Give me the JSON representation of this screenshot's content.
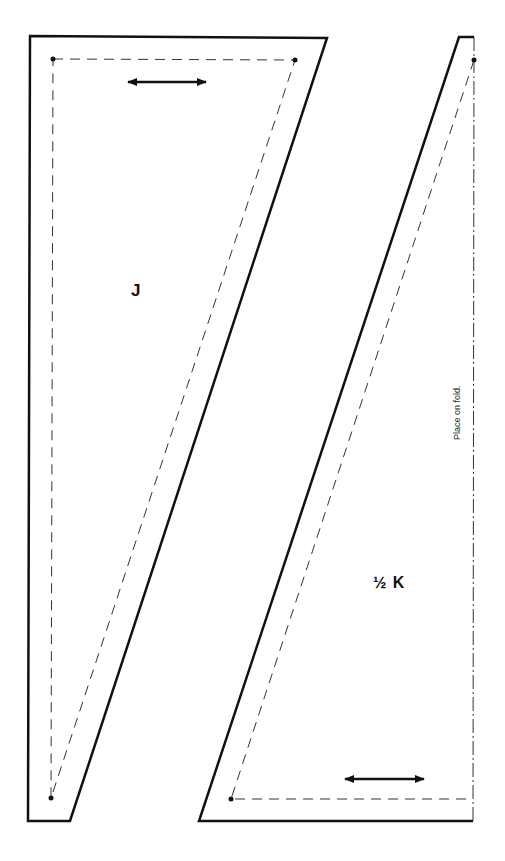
{
  "pieces": [
    {
      "id": "J",
      "label": "J",
      "grainline": "horizontal"
    },
    {
      "id": "K",
      "label": "½ K",
      "grainline": "horizontal",
      "fold_label": "Place on fold."
    }
  ],
  "colors": {
    "outline": "#111111",
    "seam": "#333333",
    "background": "#ffffff"
  }
}
